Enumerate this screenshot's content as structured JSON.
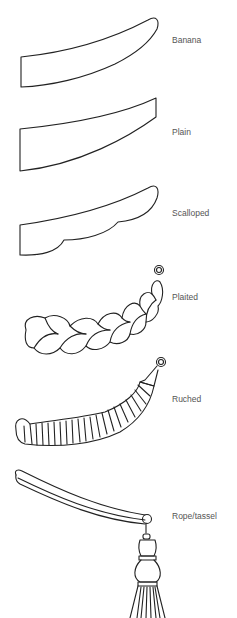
{
  "items": [
    {
      "name": "Banana",
      "icon": "banana-tieback-icon"
    },
    {
      "name": "Plain",
      "icon": "plain-tieback-icon"
    },
    {
      "name": "Scalloped",
      "icon": "scalloped-tieback-icon"
    },
    {
      "name": "Plaited",
      "icon": "plaited-tieback-icon"
    },
    {
      "name": "Ruched",
      "icon": "ruched-tieback-icon"
    },
    {
      "name": "Rope/tassel",
      "icon": "rope-tassel-tieback-icon"
    }
  ],
  "colors": {
    "stroke": "#222222",
    "label": "#555555",
    "background": "#ffffff"
  }
}
